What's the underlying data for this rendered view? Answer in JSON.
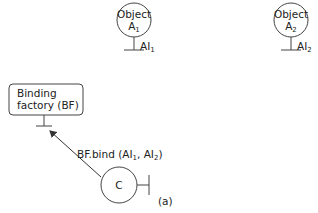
{
  "objects": [
    {
      "name": "Object",
      "sub": "1",
      "letter": "A",
      "interface": "AI",
      "interface_sub": "1"
    },
    {
      "name": "Object",
      "sub": "2",
      "letter": "A",
      "interface": "AI",
      "interface_sub": "2"
    }
  ],
  "factory": {
    "line1": "Binding",
    "line2": "factory (BF)"
  },
  "client": {
    "label": "C"
  },
  "call": {
    "text": "BF.bind (AI",
    "sub1": "1",
    "mid": ", AI",
    "sub2": "2",
    "end": ")"
  },
  "figure_label": "(a)"
}
